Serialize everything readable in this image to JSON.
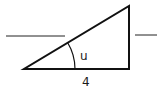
{
  "diagram": {
    "type": "right-triangle",
    "angle_label": "u",
    "base_label": "4",
    "blank_lines": [
      "left",
      "right"
    ],
    "colors": {
      "stroke": "#111111",
      "background": "#ffffff"
    }
  }
}
